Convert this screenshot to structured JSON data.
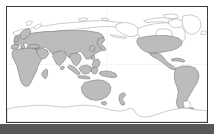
{
  "figure": {
    "kind": "world-map",
    "projection": "Pacific-centered equirectangular"
  },
  "frame": {
    "border_color": "#3a3a3c",
    "border_width_px": 1.5,
    "inner_background": "#ffffff",
    "left_px": 6,
    "top_px": 6,
    "width_px": 202,
    "height_px": 117
  },
  "margins": {
    "bottom_band_color": "#58585a",
    "bottom_band_height_px": 10,
    "page_background": "#ffffff"
  },
  "palette": {
    "ocean": "#ffffff",
    "land_fill": "#bcbcbc",
    "land_stroke": "#5d5d5d",
    "unfilled_land_fill": "#ffffff",
    "unfilled_land_stroke": "#808080",
    "graticule": "#d8d8d8"
  },
  "legend": {
    "visible": false,
    "entries": []
  },
  "labels": {
    "visible": false,
    "items": []
  },
  "regions": [
    {
      "id": "eurasia",
      "name": "Eurasia",
      "shading": "filled"
    },
    {
      "id": "africa",
      "name": "Africa",
      "shading": "filled"
    },
    {
      "id": "arabia",
      "name": "Arabian Peninsula",
      "shading": "filled"
    },
    {
      "id": "india",
      "name": "Indian Subcontinent",
      "shading": "filled"
    },
    {
      "id": "southeast-asia",
      "name": "Southeast Asia",
      "shading": "filled"
    },
    {
      "id": "japan",
      "name": "Japan",
      "shading": "filled"
    },
    {
      "id": "philippines",
      "name": "Philippines",
      "shading": "filled"
    },
    {
      "id": "indonesia",
      "name": "Indonesia",
      "shading": "filled"
    },
    {
      "id": "new-guinea",
      "name": "New Guinea",
      "shading": "filled"
    },
    {
      "id": "australia",
      "name": "Australia",
      "shading": "filled"
    },
    {
      "id": "new-zealand",
      "name": "New Zealand",
      "shading": "filled"
    },
    {
      "id": "united-states",
      "name": "United States",
      "shading": "filled"
    },
    {
      "id": "mexico",
      "name": "Mexico and Central America",
      "shading": "filled"
    },
    {
      "id": "south-america",
      "name": "South America",
      "shading": "filled"
    },
    {
      "id": "caribbean",
      "name": "Caribbean islands",
      "shading": "filled"
    },
    {
      "id": "british-isles",
      "name": "British Isles",
      "shading": "filled"
    },
    {
      "id": "scandinavia",
      "name": "Scandinavia",
      "shading": "filled"
    },
    {
      "id": "madagascar",
      "name": "Madagascar",
      "shading": "filled"
    },
    {
      "id": "canada",
      "name": "Canada",
      "shading": "outline"
    },
    {
      "id": "alaska",
      "name": "Alaska",
      "shading": "outline"
    },
    {
      "id": "greenland",
      "name": "Greenland",
      "shading": "outline"
    },
    {
      "id": "iceland",
      "name": "Iceland",
      "shading": "outline"
    },
    {
      "id": "arctic-islands",
      "name": "Canadian Arctic Archipelago",
      "shading": "outline"
    },
    {
      "id": "siberia-arctic",
      "name": "Arctic Siberian islands",
      "shading": "outline"
    },
    {
      "id": "antarctica",
      "name": "Antarctica",
      "shading": "outline"
    }
  ]
}
